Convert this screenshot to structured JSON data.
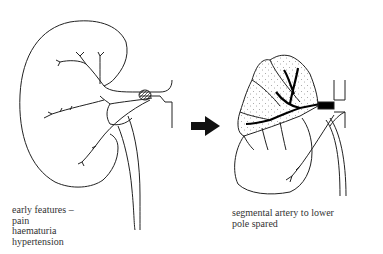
{
  "diagram": {
    "left_panel": {
      "subject": "kidney with renal artery occlusion",
      "caption_lines": [
        "early features –",
        "pain",
        "haematuria",
        "hypertension"
      ]
    },
    "arrow": {
      "icon": "right-arrow-icon",
      "color": "#111111"
    },
    "right_panel": {
      "subject": "kidney with infarcted upper segment (stippled) and blackened occluded artery",
      "caption_lines": [
        "segmental artery to lower",
        "pole spared"
      ]
    }
  }
}
